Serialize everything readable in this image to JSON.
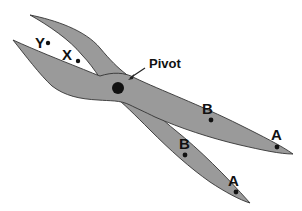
{
  "diagram": {
    "type": "lever-scissors",
    "fill_color": "#9a9a9a",
    "outline_color": "#333333",
    "labels": {
      "pivot": "Pivot",
      "y": "Y",
      "x": "X",
      "b_upper": "B",
      "a_upper": "A",
      "b_lower": "B",
      "a_lower": "A"
    }
  }
}
